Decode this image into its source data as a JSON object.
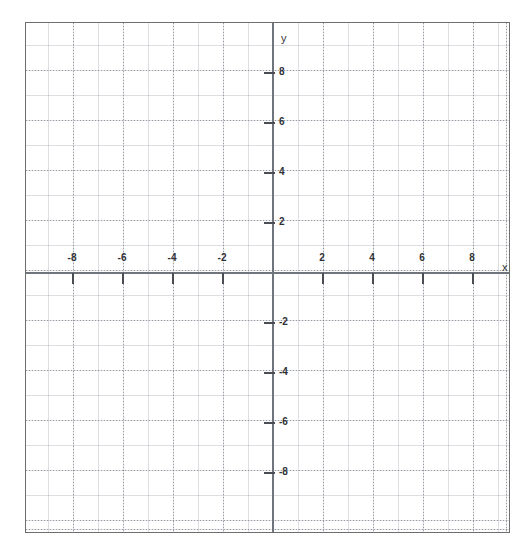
{
  "figure": {
    "kind": "cartesian-coordinate-plane",
    "background_color": "#ffffff",
    "border_color": "#6e6e6e",
    "axis_color": "#70747c",
    "tick_color": "#4a4d53",
    "grid_color": "#8c919b",
    "label_color": "#2e3136"
  },
  "axes": {
    "x_axis_name": "x",
    "y_axis_name": "y",
    "x_axis_name_position": {
      "x": 502,
      "y": 267
    },
    "y_axis_name_position": {
      "x": 281,
      "y": 38
    },
    "origin_px": {
      "x": 272,
      "y": 272
    },
    "pixels_per_unit": 25,
    "xlim": [
      -9.88,
      9.52
    ],
    "ylim": [
      -10.44,
      10.0
    ],
    "x_ticks": [
      -8,
      -6,
      -4,
      -2,
      2,
      4,
      6,
      8
    ],
    "y_ticks": [
      -8,
      -6,
      -4,
      -2,
      2,
      4,
      6,
      8
    ],
    "x_tick_labels": [
      "-8",
      "-6",
      "-4",
      "-2",
      "2",
      "4",
      "6",
      "8"
    ],
    "y_tick_labels": [
      "-8",
      "-6",
      "-4",
      "-2",
      "2",
      "4",
      "6",
      "8"
    ],
    "tick_interval": 2,
    "minor_grid_interval": 1
  },
  "chart_data": {
    "type": "line",
    "title": "",
    "subtitle": "",
    "xlabel": "x",
    "ylabel": "y",
    "xlim": [
      -9.88,
      9.52
    ],
    "ylim": [
      -10.44,
      10.0
    ],
    "x_ticks": [
      -8,
      -6,
      -4,
      -2,
      2,
      4,
      6,
      8
    ],
    "y_ticks": [
      -8,
      -6,
      -4,
      -2,
      2,
      4,
      6,
      8
    ],
    "x_tick_labels": [
      "-8",
      "-6",
      "-4",
      "-2",
      "2",
      "4",
      "6",
      "8"
    ],
    "y_tick_labels": [
      "-8",
      "-6",
      "-4",
      "-2",
      "2",
      "4",
      "6",
      "8"
    ],
    "grid": true,
    "grid_spacing_units": 1,
    "legend": null,
    "legend_position": "none",
    "annotations": [],
    "series": [],
    "note": "Blank graph paper: empty Cartesian grid with no plotted data points or curves."
  }
}
